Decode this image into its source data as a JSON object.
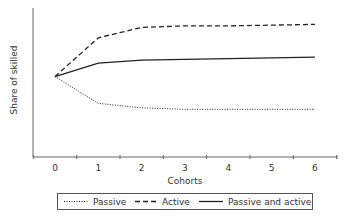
{
  "chart_data": {
    "type": "line",
    "title": "",
    "xlabel": "Cohorts",
    "ylabel": "Share of skilled",
    "categories": [
      "0",
      "1",
      "2",
      "3",
      "4",
      "5",
      "6"
    ],
    "x": [
      0,
      1,
      2,
      3,
      4,
      5,
      6
    ],
    "ylim": [
      0,
      100
    ],
    "y_ticks_shown": false,
    "grid": false,
    "legend_position": "bottom",
    "series": [
      {
        "name": "Passive",
        "style": "dotted",
        "values": [
          54,
          36,
          33,
          32,
          32,
          32,
          32
        ]
      },
      {
        "name": "Active",
        "style": "dashed",
        "values": [
          54,
          80,
          87,
          88,
          88,
          88.5,
          89
        ]
      },
      {
        "name": "Passive and active",
        "style": "solid",
        "values": [
          54,
          63,
          65,
          65.5,
          66,
          66.5,
          67
        ]
      }
    ]
  },
  "axes": {
    "xlabel": "Cohorts",
    "ylabel": "Share of skilled",
    "xticks": [
      "0",
      "1",
      "2",
      "3",
      "4",
      "5",
      "6"
    ]
  },
  "legend": {
    "items": [
      {
        "label": "Passive",
        "style": "dotted"
      },
      {
        "label": "Active",
        "style": "dashed"
      },
      {
        "label": "Passive and active",
        "style": "solid"
      }
    ]
  },
  "colors": {
    "line": "#222222",
    "axis": "#555555"
  }
}
